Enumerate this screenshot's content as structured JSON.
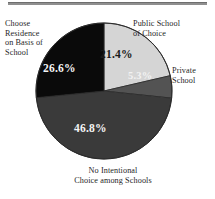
{
  "figure": {
    "name": "school-choice-pie-chart",
    "has_top_rule": true
  },
  "labels": {
    "choose_residence": "Choose\nResidence\non Basis of\nSchool",
    "public_school": "Public School\nof Choice",
    "private_school": "Private\nSchool",
    "no_intentional": "No Intentional\nChoice among Schools"
  },
  "percent_labels": {
    "public_school": "21.4%",
    "private_school": "5.3%",
    "choose_residence": "26.6%",
    "no_intentional": "46.8%"
  },
  "chart_data": {
    "type": "pie",
    "title": "",
    "xlabel": "",
    "ylabel": "",
    "start_angle_deg": 0,
    "direction": "clockwise",
    "legend_position": "outside-callouts",
    "grid": false,
    "categories": [
      "Public School of Choice",
      "Private School",
      "No Intentional Choice among Schools",
      "Choose Residence on Basis of School"
    ],
    "values": [
      21.4,
      5.3,
      46.8,
      26.6
    ],
    "value_labels": [
      "21.4%",
      "5.3%",
      "46.8%",
      "26.6%"
    ],
    "units": "percent",
    "total": 100.1,
    "slice_colors": [
      "#d5d5d5",
      "#535353",
      "#3a3a3a",
      "#0a0a0a"
    ],
    "label_text_colors": [
      "#1a1a1a",
      "#f2f2f2",
      "#f4f4f4",
      "#f4f4f4"
    ]
  },
  "geometry": {
    "center_x": 104,
    "center_y": 91,
    "radius": 68
  },
  "colors": {
    "background": "#ffffff",
    "rule": "#8f8f8f",
    "outline": "#2b2b2b",
    "text": "#1f1f1f"
  }
}
